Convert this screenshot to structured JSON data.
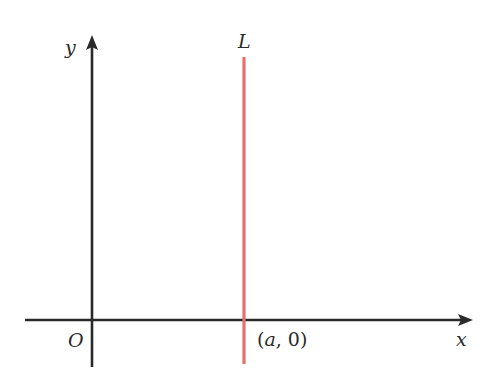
{
  "diagram": {
    "type": "coordinate-plane",
    "axes": {
      "x_label": "x",
      "y_label": "y",
      "origin_label": "O",
      "color": "#2a2a2a"
    },
    "line": {
      "label": "L",
      "point_label_open": "(",
      "point_label_var": "a",
      "point_label_rest": ", 0)",
      "description": "vertical line x = a",
      "color": "#e8706a"
    }
  }
}
